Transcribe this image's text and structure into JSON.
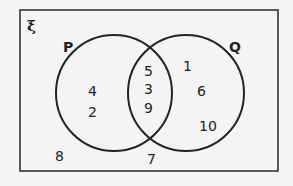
{
  "diagram": {
    "type": "venn",
    "universal_symbol": "ξ",
    "sets": [
      {
        "name": "P",
        "label": "P"
      },
      {
        "name": "Q",
        "label": "Q"
      }
    ],
    "regions": {
      "p_only": [
        "4",
        "2"
      ],
      "p_and_q": [
        "5",
        "3",
        "9"
      ],
      "q_only": [
        "1",
        "6",
        "10"
      ],
      "outside": [
        "8",
        "7"
      ]
    },
    "colors": {
      "background": "#f4f4f4",
      "stroke": "#222222",
      "text": "#222222"
    }
  }
}
